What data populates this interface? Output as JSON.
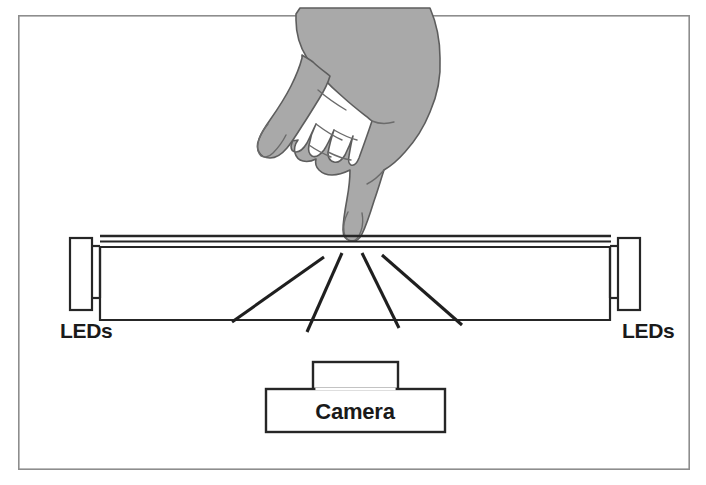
{
  "figure": {
    "background_color": "#ffffff",
    "frame": {
      "name": "figure-border",
      "x": 18,
      "y": 15,
      "width": 672,
      "height": 455,
      "stroke_color": "#8d8d8d"
    }
  },
  "labels": {
    "leds_left": "LEDs",
    "leds_right": "LEDs",
    "camera": "Camera"
  },
  "components": {
    "acrylic_panel": {
      "name": "acrylic-waveguide-panel",
      "x": 100,
      "y": 236,
      "width": 510,
      "height": 84,
      "layer_lines_y": [
        236,
        241,
        246
      ],
      "stroke_color": "#262626"
    },
    "led_left": {
      "name": "led-array-left",
      "x": 70,
      "y": 238,
      "width": 22,
      "height": 72,
      "connector_top_y": 246,
      "connector_bottom_y": 298,
      "fill": "#ffffff",
      "stroke_color": "#262626"
    },
    "led_right": {
      "name": "led-array-right",
      "x": 618,
      "y": 238,
      "width": 22,
      "height": 72,
      "connector_top_y": 246,
      "connector_bottom_y": 298,
      "fill": "#ffffff",
      "stroke_color": "#262626"
    },
    "camera_lens": {
      "name": "camera-lens-housing",
      "x": 313,
      "y": 362,
      "width": 85,
      "height": 27,
      "fill": "#ffffff",
      "stroke_color": "#262626"
    },
    "camera_body": {
      "name": "camera-body",
      "x": 266,
      "y": 389,
      "width": 179,
      "height": 43,
      "fill": "#ffffff",
      "stroke_color": "#262626"
    },
    "hand": {
      "name": "hand-silhouette",
      "fill_color": "#a9a9a9",
      "outline_color": "#5d5d5d",
      "touch_point": {
        "x": 352,
        "y": 240
      }
    }
  },
  "light_rays": {
    "name": "scattered-light-rays",
    "origin": {
      "x": 352,
      "y": 249
    },
    "stroke_color": "#1f1f1f",
    "stroke_width": 3.1,
    "segments": [
      {
        "x1": 324,
        "y1": 257,
        "x2": 232,
        "y2": 322
      },
      {
        "x1": 342,
        "y1": 253,
        "x2": 307,
        "y2": 332
      },
      {
        "x1": 362,
        "y1": 253,
        "x2": 399,
        "y2": 328
      },
      {
        "x1": 382,
        "y1": 255,
        "x2": 462,
        "y2": 325
      }
    ]
  },
  "text_positions": {
    "leds_left": {
      "x": 60,
      "y": 338
    },
    "leds_right": {
      "x": 622,
      "y": 338
    },
    "camera": {
      "x": 355,
      "y": 419
    }
  }
}
